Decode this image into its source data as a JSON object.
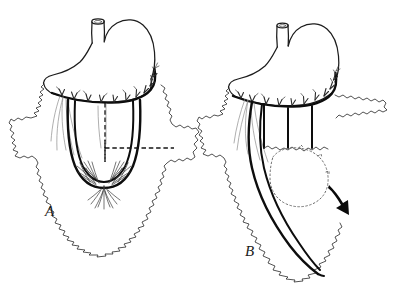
{
  "figure": {
    "background_color": "#ffffff",
    "ink_color": "#1a1a1a",
    "width": 398,
    "height": 297,
    "style": "pen-and-ink line drawing"
  },
  "panels": [
    {
      "id": "A",
      "label": "A",
      "label_x": 45,
      "label_y": 216,
      "caption": "Greater omentum spread out with gastroepiploic arcade; dashed lines mark the planned incisions outlining the U-shaped omental flap",
      "elements": [
        "esophagus-stump",
        "stomach-body",
        "greater-curvature",
        "gastroepiploic-arcade",
        "omentum-outline",
        "omental-flap-outline",
        "planned-incision-dashed",
        "omental-vessel-plexus"
      ]
    },
    {
      "id": "B",
      "label": "B",
      "label_x": 245,
      "label_y": 256,
      "caption": "The lengthened omental flap swung inferiorly on its vascular pedicle; dotted outline shows the original position and the curved arrow shows the direction of transposition",
      "elements": [
        "esophagus-stump",
        "stomach-body",
        "greater-curvature",
        "gastroepiploic-arcade",
        "omentum-outline",
        "lengthened-flap",
        "original-position-dotted",
        "transposition-arrow"
      ]
    }
  ],
  "annotations": {
    "dashed_line_meaning": "planned incision line",
    "dotted_line_meaning": "original flap position",
    "arrow_meaning": "direction of flap transposition"
  },
  "colors": {
    "ink": "#1a1a1a",
    "heavy_ink": "#0d0d0d",
    "faint_vessel": "#8d8d8d",
    "paper": "#ffffff"
  }
}
